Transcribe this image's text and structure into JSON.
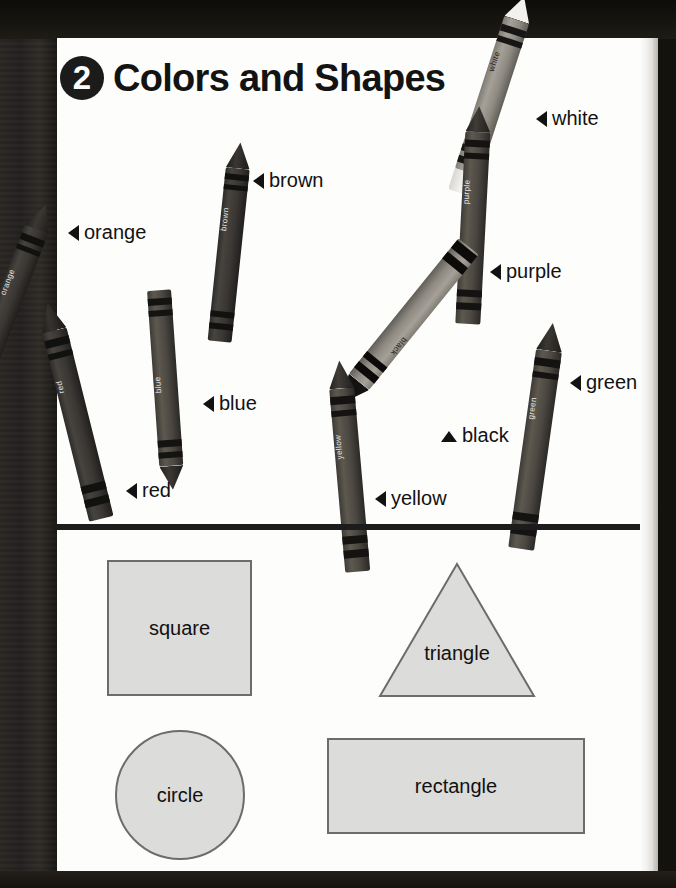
{
  "page": {
    "chapter_number": "2",
    "title": "Colors and Shapes"
  },
  "crayon_labels": [
    {
      "name": "white",
      "text": "white",
      "arrow": "left",
      "x": 536,
      "y": 107
    },
    {
      "name": "brown",
      "text": "brown",
      "arrow": "left",
      "x": 253,
      "y": 169
    },
    {
      "name": "orange",
      "text": "orange",
      "arrow": "left",
      "x": 68,
      "y": 221
    },
    {
      "name": "purple",
      "text": "purple",
      "arrow": "left",
      "x": 490,
      "y": 260
    },
    {
      "name": "green",
      "text": "green",
      "arrow": "left",
      "x": 570,
      "y": 371
    },
    {
      "name": "blue",
      "text": "blue",
      "arrow": "left",
      "x": 203,
      "y": 392
    },
    {
      "name": "black",
      "text": "black",
      "arrow": "up",
      "x": 441,
      "y": 424
    },
    {
      "name": "red",
      "text": "red",
      "arrow": "left",
      "x": 126,
      "y": 479
    },
    {
      "name": "yellow",
      "text": "yellow",
      "arrow": "left",
      "x": 375,
      "y": 487
    }
  ],
  "crayon_barrel_text": {
    "white": "white",
    "purple": "purple",
    "brown": "brown",
    "orange": "orange",
    "blue": "blue",
    "red": "red",
    "black": "black",
    "green": "green",
    "yellow": "yellow"
  },
  "shapes": [
    {
      "name": "square",
      "label": "square"
    },
    {
      "name": "triangle",
      "label": "triangle"
    },
    {
      "name": "circle",
      "label": "circle"
    },
    {
      "name": "rectangle",
      "label": "rectangle"
    }
  ],
  "colors": {
    "page_background": "#fdfdfc",
    "scan_background": "#231f1a",
    "ink": "#121212",
    "shape_fill": "#dcdcda",
    "shape_stroke": "#6c6c6a",
    "rule": "#1c1c1c"
  }
}
